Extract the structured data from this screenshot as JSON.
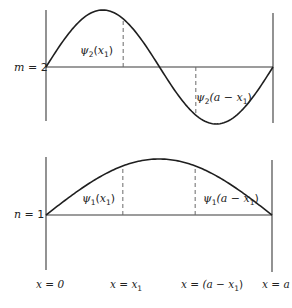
{
  "figure": {
    "panels": [
      {
        "id": "top",
        "mode_label": "m = 2",
        "mode_letter": "m",
        "mode_value": "2",
        "mode_index": 2,
        "point_labels": [
          {
            "func": "ψ",
            "sub": "2",
            "arg_pre": "(",
            "arg": "x",
            "arg_sub": "1",
            "arg_post": ")"
          },
          {
            "func": "ψ",
            "sub": "2",
            "arg_pre": "(a − ",
            "arg": "x",
            "arg_sub": "1",
            "arg_post": ")"
          }
        ]
      },
      {
        "id": "bottom",
        "mode_label": "n = 1",
        "mode_letter": "n",
        "mode_value": "1",
        "mode_index": 1,
        "point_labels": [
          {
            "func": "ψ",
            "sub": "1",
            "arg_pre": "(",
            "arg": "x",
            "arg_sub": "1",
            "arg_post": ")"
          },
          {
            "func": "ψ",
            "sub": "1",
            "arg_pre": "(a − ",
            "arg": "x",
            "arg_sub": "1",
            "arg_post": ")"
          }
        ]
      }
    ],
    "x_labels": [
      {
        "text": "x = 0",
        "pre": "x = 0",
        "sub": "",
        "post": ""
      },
      {
        "text": "x = x1",
        "pre": "x = x",
        "sub": "1",
        "post": ""
      },
      {
        "text": "x = (a − x1)",
        "pre": "x = (a − x",
        "sub": "1",
        "post": ")"
      },
      {
        "text": "x = a",
        "pre": "x = a",
        "sub": "",
        "post": ""
      }
    ],
    "x1_fraction": 0.34,
    "colors": {
      "line": "#1f1f1f",
      "axis": "#3a3a3a",
      "dash": "#6a6a6a",
      "background": "#ffffff"
    }
  }
}
